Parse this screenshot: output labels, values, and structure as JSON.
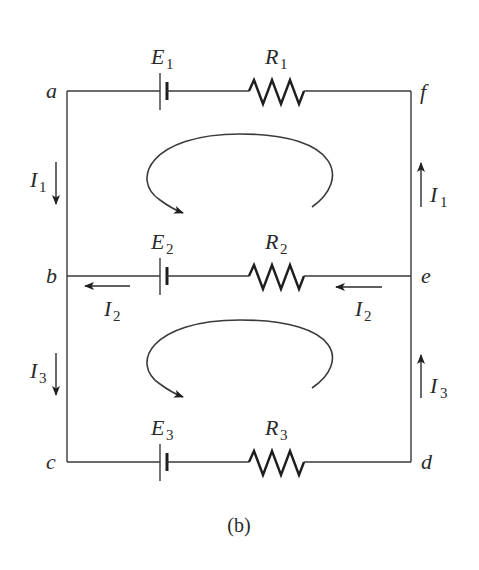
{
  "figure": {
    "caption": "(b)",
    "nodes": {
      "a": "a",
      "b": "b",
      "c": "c",
      "d": "d",
      "e": "e",
      "f": "f"
    },
    "branches": [
      {
        "battery": {
          "symbol": "E",
          "sub": "1"
        },
        "resistor": {
          "symbol": "R",
          "sub": "1"
        },
        "between": "a-f"
      },
      {
        "battery": {
          "symbol": "E",
          "sub": "2"
        },
        "resistor": {
          "symbol": "R",
          "sub": "2"
        },
        "between": "b-e"
      },
      {
        "battery": {
          "symbol": "E",
          "sub": "3"
        },
        "resistor": {
          "symbol": "R",
          "sub": "3"
        },
        "between": "c-d"
      }
    ],
    "currents": {
      "I1_left": {
        "symbol": "I",
        "sub": "1",
        "direction": "down"
      },
      "I1_right": {
        "symbol": "I",
        "sub": "1",
        "direction": "up"
      },
      "I2_left": {
        "symbol": "I",
        "sub": "2",
        "direction": "left"
      },
      "I2_right": {
        "symbol": "I",
        "sub": "2",
        "direction": "left"
      },
      "I3_left": {
        "symbol": "I",
        "sub": "3",
        "direction": "down"
      },
      "I3_right": {
        "symbol": "I",
        "sub": "3",
        "direction": "up"
      }
    },
    "loops": [
      {
        "name": "upper-loop",
        "direction": "counterclockwise"
      },
      {
        "name": "lower-loop",
        "direction": "counterclockwise"
      }
    ]
  }
}
